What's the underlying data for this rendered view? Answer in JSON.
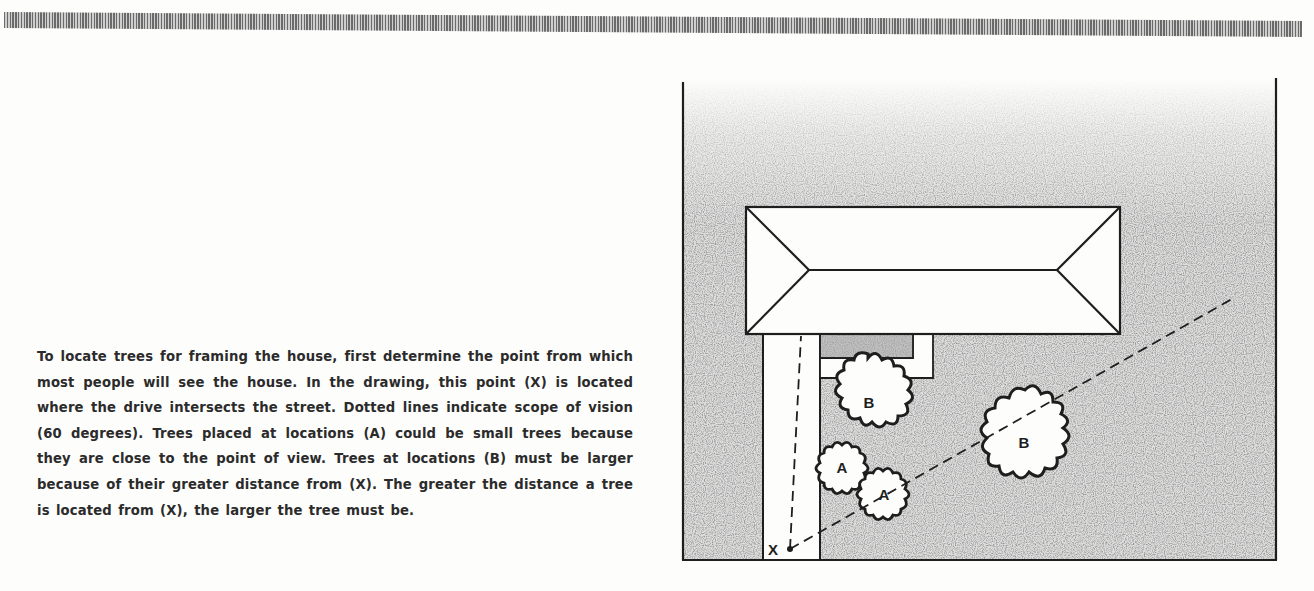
{
  "page": {
    "caption": "To locate trees for framing the house, first determine the point from which most people will see the house. In the drawing, this point (X) is located where the drive intersects the street. Dotted lines indicate scope of vision (60 degrees). Trees placed at locations (A) could be small trees because they are close to the point of view. Trees at locations (B) must be larger because of their greater distance from (X). The greater the distance a tree is located from (X), the larger the tree must be."
  },
  "diagram": {
    "viewpoint_label": "X",
    "vision_angle": "60 degrees",
    "trees": [
      {
        "label": "B",
        "size": "large",
        "position": "near house, right of drive"
      },
      {
        "label": "A",
        "size": "small",
        "position": "near drive"
      },
      {
        "label": "A",
        "size": "small",
        "position": "near drive, lower"
      },
      {
        "label": "B",
        "size": "large",
        "position": "open lawn, right"
      }
    ],
    "colors": {
      "ink": "#1e1e1e",
      "lawn_stipple": "#9a9a9a",
      "paper": "#fdfdfc"
    }
  }
}
